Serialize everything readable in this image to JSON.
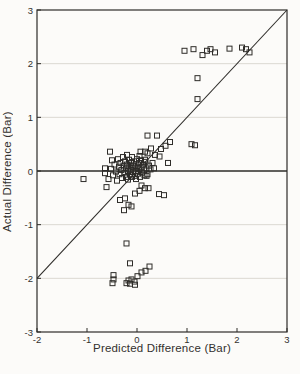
{
  "figure": {
    "kind": "scanned-scatter-plot",
    "background": "#fcfbf9"
  },
  "chart_data": {
    "type": "scatter",
    "title": "",
    "xlabel": "Predicted Difference (Bar)",
    "ylabel": "Actual Difference (Bar)",
    "xlim": [
      -2,
      3
    ],
    "ylim": [
      -3,
      3
    ],
    "xticks": [
      -2,
      -1,
      0,
      1,
      2,
      3
    ],
    "yticks": [
      -3,
      -2,
      -1,
      0,
      1,
      2,
      3
    ],
    "grid": "horizontal-light",
    "legend": "none",
    "marker": "open-square",
    "marker_size_px": 5,
    "colors": {
      "axis": "#2e2c29",
      "marker": "#2e2c29",
      "grid": "#dbd8d2",
      "line": "#2e2c29"
    },
    "reference_lines": [
      {
        "name": "identity-line",
        "type": "segment",
        "from": [
          -2,
          -2
        ],
        "to": [
          3,
          3
        ]
      },
      {
        "name": "zero-line",
        "type": "horizontal",
        "y": 0
      }
    ],
    "points": [
      [
        0.95,
        2.24
      ],
      [
        1.13,
        2.27
      ],
      [
        1.31,
        2.16
      ],
      [
        1.4,
        2.24
      ],
      [
        1.47,
        2.27
      ],
      [
        1.56,
        2.21
      ],
      [
        1.85,
        2.28
      ],
      [
        2.1,
        2.3
      ],
      [
        2.18,
        2.27
      ],
      [
        2.25,
        2.21
      ],
      [
        1.21,
        1.73
      ],
      [
        1.21,
        1.34
      ],
      [
        1.09,
        0.5
      ],
      [
        1.16,
        0.48
      ],
      [
        0.66,
        0.54
      ],
      [
        0.57,
        0.47
      ],
      [
        0.48,
        0.41
      ],
      [
        0.4,
        0.66
      ],
      [
        0.28,
        0.42
      ],
      [
        0.21,
        0.66
      ],
      [
        0.36,
        0.3
      ],
      [
        0.21,
        0.33
      ],
      [
        0.16,
        0.21
      ],
      [
        0.07,
        0.36
      ],
      [
        0.16,
        0.36
      ],
      [
        0.05,
        0.28
      ],
      [
        0.45,
        0.27
      ],
      [
        0.62,
        0.15
      ],
      [
        -0.64,
        0.05
      ],
      [
        -0.64,
        -0.04
      ],
      [
        -0.57,
        -0.15
      ],
      [
        -0.61,
        -0.3
      ],
      [
        -0.54,
        0.36
      ],
      [
        -0.5,
        0.2
      ],
      [
        -0.52,
        0.04
      ],
      [
        -0.48,
        -0.08
      ],
      [
        -0.45,
        0.12
      ],
      [
        -0.42,
        -0.01
      ],
      [
        -0.4,
        -0.18
      ],
      [
        -0.38,
        0.22
      ],
      [
        -0.36,
        0.08
      ],
      [
        -0.35,
        -0.06
      ],
      [
        -0.33,
        0.15
      ],
      [
        -0.31,
        0.02
      ],
      [
        -0.3,
        -0.13
      ],
      [
        -0.28,
        0.26
      ],
      [
        -0.27,
        0.1
      ],
      [
        -0.25,
        -0.03
      ],
      [
        -0.24,
        0.18
      ],
      [
        -0.22,
        0.05
      ],
      [
        -0.22,
        -0.11
      ],
      [
        -0.2,
        0.3
      ],
      [
        -0.2,
        0.12
      ],
      [
        -0.18,
        0.0
      ],
      [
        -0.18,
        -0.16
      ],
      [
        -0.16,
        0.21
      ],
      [
        -0.15,
        0.07
      ],
      [
        -0.14,
        -0.06
      ],
      [
        -0.12,
        0.15
      ],
      [
        -0.12,
        0.02
      ],
      [
        -0.1,
        -0.11
      ],
      [
        -0.1,
        0.26
      ],
      [
        -0.08,
        0.1
      ],
      [
        -0.08,
        -0.02
      ],
      [
        -0.06,
        0.18
      ],
      [
        -0.05,
        0.05
      ],
      [
        -0.05,
        -0.09
      ],
      [
        -0.03,
        0.12
      ],
      [
        -0.02,
        0.0
      ],
      [
        -0.02,
        -0.15
      ],
      [
        0.0,
        0.22
      ],
      [
        0.01,
        0.08
      ],
      [
        0.02,
        -0.05
      ],
      [
        0.04,
        0.15
      ],
      [
        0.05,
        0.03
      ],
      [
        0.06,
        -0.11
      ],
      [
        0.08,
        0.2
      ],
      [
        0.09,
        0.07
      ],
      [
        0.1,
        -0.03
      ],
      [
        0.12,
        0.12
      ],
      [
        0.14,
        0.01
      ],
      [
        0.15,
        -0.08
      ],
      [
        0.17,
        0.17
      ],
      [
        0.19,
        0.05
      ],
      [
        0.21,
        -0.06
      ],
      [
        0.24,
        0.1
      ],
      [
        0.27,
        0.03
      ],
      [
        0.31,
        0.15
      ],
      [
        0.34,
        0.05
      ],
      [
        0.19,
        -0.09
      ],
      [
        -1.07,
        -0.15
      ],
      [
        0.09,
        -0.27
      ],
      [
        0.16,
        -0.32
      ],
      [
        0.23,
        -0.32
      ],
      [
        0.05,
        -0.37
      ],
      [
        -0.04,
        -0.42
      ],
      [
        -0.24,
        -0.51
      ],
      [
        -0.34,
        -0.54
      ],
      [
        -0.17,
        -0.63
      ],
      [
        -0.11,
        -0.66
      ],
      [
        -0.26,
        -0.73
      ],
      [
        0.44,
        -0.43
      ],
      [
        0.54,
        -0.45
      ],
      [
        -0.21,
        -1.35
      ],
      [
        -0.14,
        -1.72
      ],
      [
        -0.47,
        -1.94
      ],
      [
        -0.47,
        -2.02
      ],
      [
        -0.49,
        -2.09
      ],
      [
        -0.21,
        -2.09
      ],
      [
        -0.17,
        -2.04
      ],
      [
        -0.14,
        -2.1
      ],
      [
        -0.11,
        -2.02
      ],
      [
        -0.05,
        -2.06
      ],
      [
        -0.04,
        -2.12
      ],
      [
        0.01,
        -1.96
      ],
      [
        0.09,
        -1.89
      ],
      [
        0.17,
        -1.86
      ],
      [
        0.25,
        -1.78
      ]
    ]
  }
}
